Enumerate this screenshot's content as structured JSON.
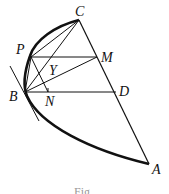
{
  "diagram": {
    "type": "geometry-parabola",
    "points": {
      "C": {
        "label": "C",
        "x": 79,
        "y": 20
      },
      "P": {
        "label": "P",
        "x": 31,
        "y": 57
      },
      "M": {
        "label": "M",
        "x": 97,
        "y": 57
      },
      "Y": {
        "label": "Y",
        "x": 53,
        "y": 64
      },
      "B": {
        "label": "B",
        "x": 25,
        "y": 92
      },
      "N": {
        "label": "N",
        "x": 48,
        "y": 92
      },
      "D": {
        "label": "D",
        "x": 116,
        "y": 92
      },
      "A": {
        "label": "A",
        "x": 149,
        "y": 164
      }
    },
    "segments": [
      "CA",
      "PM",
      "BD",
      "CB",
      "PB",
      "PN",
      "BM",
      "PC"
    ],
    "curve": "parabolic arc C-P-B-A",
    "tangent": "tangent line at B",
    "caption": "Fig."
  },
  "colors": {
    "ink": "#111111",
    "background": "#ffffff"
  }
}
